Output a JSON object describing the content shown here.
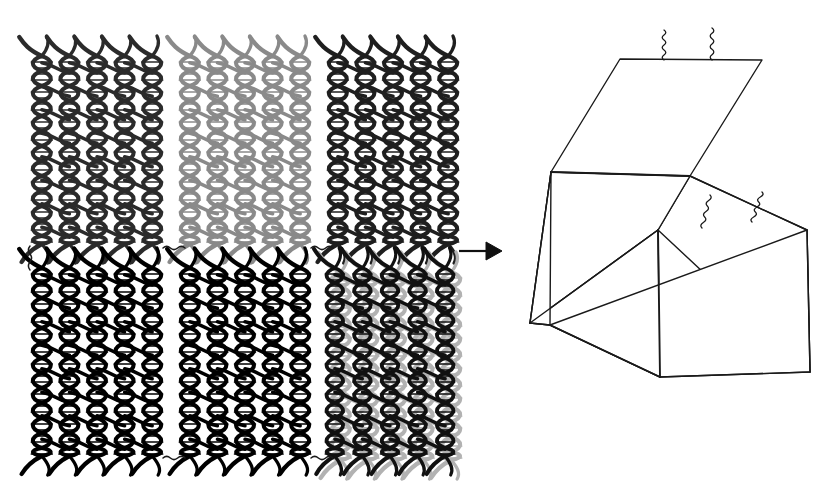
{
  "figure": {
    "background_color": "#ffffff",
    "width": 822,
    "height": 490,
    "reaction_arrow": {
      "name": "assembly-arrow",
      "direction": "right",
      "color": "#101010",
      "x1": 459,
      "y1": 251,
      "x2": 500,
      "y2": 251,
      "label": ""
    }
  },
  "panels": {
    "rows": 2,
    "columns": 3,
    "helices_per_panel": 5,
    "crossovers_per_helix": 8,
    "items": [
      {
        "id": "panel-1",
        "name": "dna-panel-top-left",
        "row": 0,
        "col": 0,
        "x": 28,
        "y": 40,
        "width": 138,
        "height": 220,
        "color": "#2b2b2b",
        "shade": "dark-charcoal",
        "overlay_color": "",
        "label": "Panel 1"
      },
      {
        "id": "panel-2",
        "name": "dna-panel-top-center",
        "row": 0,
        "col": 1,
        "x": 176,
        "y": 40,
        "width": 138,
        "height": 220,
        "color": "#8a8a8a",
        "shade": "medium-gray",
        "overlay_color": "",
        "label": "Panel 2"
      },
      {
        "id": "panel-3",
        "name": "dna-panel-top-right",
        "row": 0,
        "col": 2,
        "x": 324,
        "y": 40,
        "width": 138,
        "height": 220,
        "color": "#1f1f1f",
        "shade": "near-black",
        "overlay_color": "",
        "label": "Panel 3"
      },
      {
        "id": "panel-4",
        "name": "dna-panel-bottom-left",
        "row": 1,
        "col": 0,
        "x": 28,
        "y": 252,
        "width": 138,
        "height": 220,
        "color": "#000000",
        "shade": "black",
        "overlay_color": "",
        "label": "Panel 4"
      },
      {
        "id": "panel-5",
        "name": "dna-panel-bottom-center",
        "row": 1,
        "col": 1,
        "x": 176,
        "y": 252,
        "width": 138,
        "height": 220,
        "color": "#000000",
        "shade": "black",
        "overlay_color": "",
        "label": "Panel 5"
      },
      {
        "id": "panel-6",
        "name": "dna-panel-bottom-right",
        "row": 1,
        "col": 2,
        "x": 324,
        "y": 252,
        "width": 138,
        "height": 220,
        "color": "#b2b2b2",
        "shade": "light-gray-with-dark-overlay",
        "overlay_color": "#111111",
        "label": "Panel 6"
      }
    ]
  },
  "connectors": {
    "description": "single-stranded wavy DNA staple extensions linking panel edges",
    "color": "#1a1a1a",
    "items": [
      {
        "name": "connector-strand-top-1",
        "x": 163,
        "y": 248,
        "length": 22,
        "orientation": "horizontal"
      },
      {
        "name": "connector-strand-top-2",
        "x": 311,
        "y": 248,
        "length": 22,
        "orientation": "horizontal"
      },
      {
        "name": "connector-strand-left-top",
        "x": 30,
        "y": 246,
        "length": 24,
        "orientation": "vertical"
      },
      {
        "name": "connector-strand-bottom-1",
        "x": 163,
        "y": 458,
        "length": 22,
        "orientation": "horizontal"
      },
      {
        "name": "connector-strand-bottom-2",
        "x": 311,
        "y": 458,
        "length": 22,
        "orientation": "horizontal"
      }
    ]
  },
  "box": {
    "name": "dna-origami-box",
    "stroke_color": "#1a1a1a",
    "fill_color": "#ffffff",
    "stroke_width": 1.4,
    "state": "open-lid",
    "vertices": {
      "lid_back_left": [
        620,
        59
      ],
      "lid_back_right": [
        762,
        60
      ],
      "lid_front_left": [
        551,
        172
      ],
      "lid_front_right": [
        690,
        176
      ],
      "top_front": [
        658,
        230
      ],
      "rim_right": [
        807,
        230
      ],
      "bottom_front_left": [
        550,
        325
      ],
      "bottom_front_center": [
        660,
        377
      ],
      "bottom_right": [
        810,
        372
      ],
      "front_face_left_bottom": [
        530,
        323
      ]
    },
    "lock_strands": [
      {
        "name": "lid-lock-strand-1",
        "x": 664,
        "y": 30,
        "attach_x": 664,
        "attach_y": 60
      },
      {
        "name": "lid-lock-strand-2",
        "x": 712,
        "y": 28,
        "attach_x": 712,
        "attach_y": 60
      },
      {
        "name": "rim-lock-strand-1",
        "x": 710,
        "y": 195,
        "attach_x": 702,
        "attach_y": 228
      },
      {
        "name": "rim-lock-strand-2",
        "x": 762,
        "y": 192,
        "attach_x": 752,
        "attach_y": 222
      }
    ]
  }
}
